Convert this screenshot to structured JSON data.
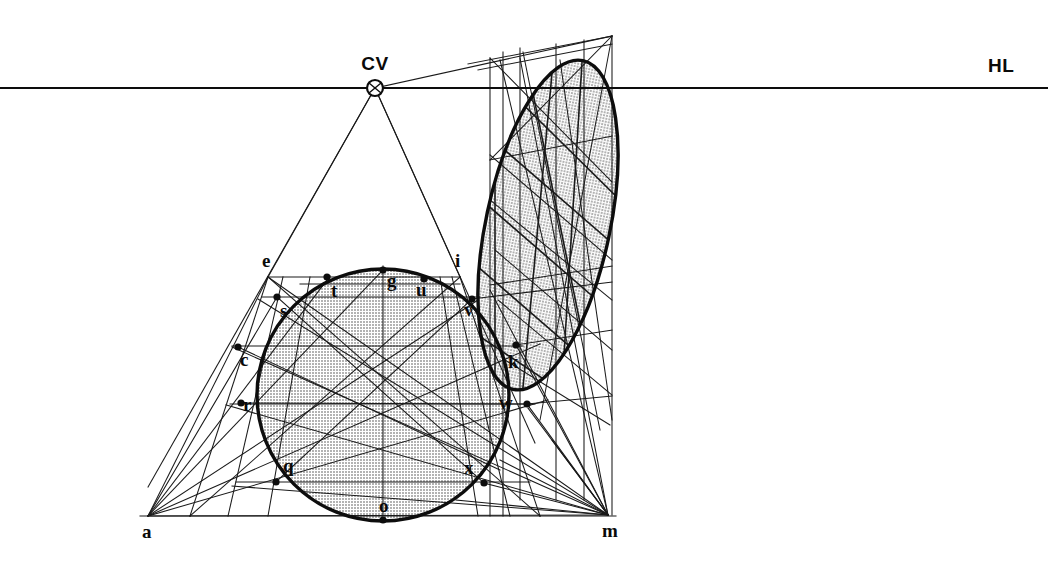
{
  "figure": {
    "background_color": "#ffffff",
    "ink_color": "#111111",
    "fill_color": "#c9c9c9",
    "width": 1048,
    "height": 582
  },
  "horizon": {
    "label": "HL",
    "label_x": 988,
    "label_y": 72,
    "y": 88,
    "x_start": 0,
    "x_end": 1048
  },
  "center_of_vision": {
    "label": "CV",
    "label_x": 375,
    "label_y": 70,
    "x": 375,
    "y": 88,
    "marker_radius": 8
  },
  "ground_line": {
    "y": 516,
    "x_start": 140,
    "x_end": 616
  },
  "anchors": [
    {
      "id": "a",
      "label": "a",
      "x": 148,
      "y": 516,
      "label_x": 142,
      "label_y": 538,
      "dot": false
    },
    {
      "id": "m",
      "label": "m",
      "x": 608,
      "y": 515,
      "label_x": 602,
      "label_y": 537,
      "dot": false
    }
  ],
  "circle": {
    "cx": 383,
    "cy": 395,
    "r": 126,
    "stroke_width": 3.4
  },
  "circle_points": [
    {
      "id": "e",
      "label": "e",
      "x": 268,
      "y": 276,
      "label_x": 262,
      "label_y": 267,
      "dot": false
    },
    {
      "id": "i",
      "label": "i",
      "x": 460,
      "y": 276,
      "label_x": 455,
      "label_y": 267,
      "dot": false
    },
    {
      "id": "g",
      "label": "g",
      "x": 383,
      "y": 270,
      "label_x": 387,
      "label_y": 287,
      "dot": true
    },
    {
      "id": "t",
      "label": "t",
      "x": 327,
      "y": 277,
      "label_x": 331,
      "label_y": 297,
      "dot": true
    },
    {
      "id": "u",
      "label": "u",
      "x": 424,
      "y": 279,
      "label_x": 416,
      "label_y": 296,
      "dot": true
    },
    {
      "id": "s",
      "label": "s",
      "x": 277,
      "y": 297,
      "label_x": 280,
      "label_y": 317,
      "dot": true
    },
    {
      "id": "v",
      "label": "v",
      "x": 472,
      "y": 299,
      "label_x": 464,
      "label_y": 316,
      "dot": true
    },
    {
      "id": "c",
      "label": "c",
      "x": 238,
      "y": 347,
      "label_x": 240,
      "label_y": 366,
      "dot": true
    },
    {
      "id": "k",
      "label": "k",
      "x": 516,
      "y": 345,
      "label_x": 508,
      "label_y": 368,
      "dot": true
    },
    {
      "id": "r",
      "label": "r",
      "x": 241,
      "y": 403,
      "label_x": 243,
      "label_y": 411,
      "dot": true
    },
    {
      "id": "w",
      "label": "w",
      "x": 527,
      "y": 404,
      "label_x": 499,
      "label_y": 409,
      "dot": true
    },
    {
      "id": "q",
      "label": "q",
      "x": 276,
      "y": 482,
      "label_x": 283,
      "label_y": 472,
      "dot": true
    },
    {
      "id": "x",
      "label": "x",
      "x": 484,
      "y": 483,
      "label_x": 464,
      "label_y": 474,
      "dot": true
    },
    {
      "id": "o",
      "label": "o",
      "x": 383,
      "y": 520,
      "label_x": 379,
      "label_y": 512,
      "dot": true
    }
  ],
  "ellipse": {
    "cx": 548,
    "cy": 225,
    "rx": 62,
    "ry": 168,
    "rotation_deg": 12,
    "stroke_width": 3.4
  },
  "construction": {
    "square_top_y": 277,
    "square_bottom_y": 516,
    "square_left_x": 268,
    "square_right_x": 460,
    "right_box_top_y": 36,
    "right_box_bottom_y": 516,
    "right_box_left_x": 490,
    "right_box_right_x": 612
  }
}
